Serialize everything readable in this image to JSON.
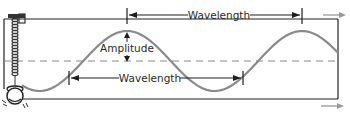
{
  "diagram": {
    "type": "transverse-wave",
    "labels": {
      "wavelength_top": "Wavelength",
      "wavelength_bottom": "Wavelength",
      "amplitude": "Amplitude"
    },
    "colors": {
      "wave": "#8a8a8a",
      "frame": "#222222",
      "dashed_axis": "#8a8a8a",
      "motion_arrow": "#9a9a9a",
      "annotation": "#1e1e1e"
    },
    "wave": {
      "cycles_shown": 1.75
    },
    "elements": {
      "spring": "coil-spring-icon",
      "weight": "hanging-weight-icon",
      "motion_indicators": [
        "arrow-right-icon",
        "arrow-right-icon"
      ]
    }
  }
}
